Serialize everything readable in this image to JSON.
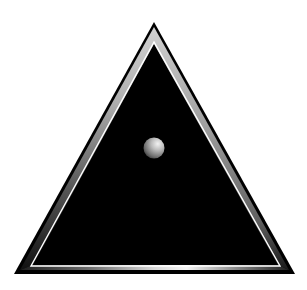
{
  "figure": {
    "description": "Black triangle with metallic beveled frame and a small gray sphere",
    "colors": {
      "background": "#ffffff",
      "outline": "#000000",
      "fill": "#000000",
      "bevel_dark": "#2a2a2a",
      "bevel_mid": "#8a8a8a",
      "bevel_light": "#e8e8e8",
      "highlight": "#ffffff"
    },
    "shapes": {
      "outer_triangle": "triangle",
      "inner_triangle": "triangle",
      "orb": "sphere"
    }
  }
}
